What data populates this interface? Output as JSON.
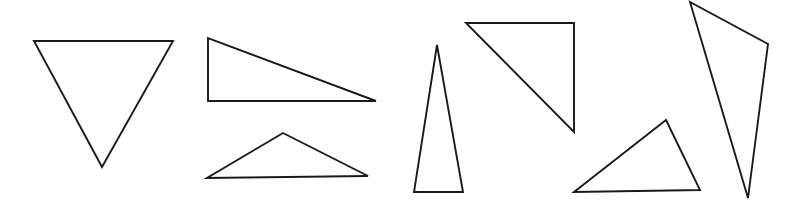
{
  "figure": {
    "background_color": "#ffffff",
    "stroke_color": "#1a1a1a",
    "stroke_width": 1.9,
    "fill": "none",
    "width": 796,
    "height": 206,
    "shape_count": 7
  },
  "shapes": [
    {
      "id": "triangle-1",
      "name": "inverted-triangle",
      "orientation": "point-down",
      "points": "34,41 173,41 102,167",
      "vertices": [
        [
          34,
          41
        ],
        [
          173,
          41
        ],
        [
          102,
          167
        ]
      ]
    },
    {
      "id": "triangle-2",
      "name": "right-triangle-wide",
      "orientation": "right-angle-bottom-left",
      "points": "208,38 208,101 376,101",
      "vertices": [
        [
          208,
          38
        ],
        [
          208,
          101
        ],
        [
          376,
          101
        ]
      ]
    },
    {
      "id": "triangle-3",
      "name": "flat-obtuse-triangle",
      "orientation": "point-up",
      "points": "283,133 368,176 207,178",
      "vertices": [
        [
          283,
          133
        ],
        [
          368,
          176
        ],
        [
          207,
          178
        ]
      ]
    },
    {
      "id": "triangle-4",
      "name": "narrow-tall-triangle",
      "orientation": "point-up",
      "points": "437,45 463,192 414,192",
      "vertices": [
        [
          437,
          45
        ],
        [
          463,
          192
        ],
        [
          414,
          192
        ]
      ]
    },
    {
      "id": "triangle-5",
      "name": "right-triangle-rotated",
      "orientation": "right-angle-top-right",
      "points": "466,23 574,23 574,132",
      "vertices": [
        [
          466,
          23
        ],
        [
          574,
          23
        ],
        [
          574,
          132
        ]
      ]
    },
    {
      "id": "triangle-6",
      "name": "scalene-triangle",
      "orientation": "point-up",
      "points": "666,120 700,190 574,192",
      "vertices": [
        [
          666,
          120
        ],
        [
          700,
          190
        ],
        [
          574,
          192
        ]
      ]
    },
    {
      "id": "triangle-7",
      "name": "thin-slanted-triangle",
      "orientation": "point-down",
      "points": "690,2 768,44 748,198",
      "vertices": [
        [
          690,
          2
        ],
        [
          768,
          44
        ],
        [
          748,
          198
        ]
      ]
    }
  ]
}
